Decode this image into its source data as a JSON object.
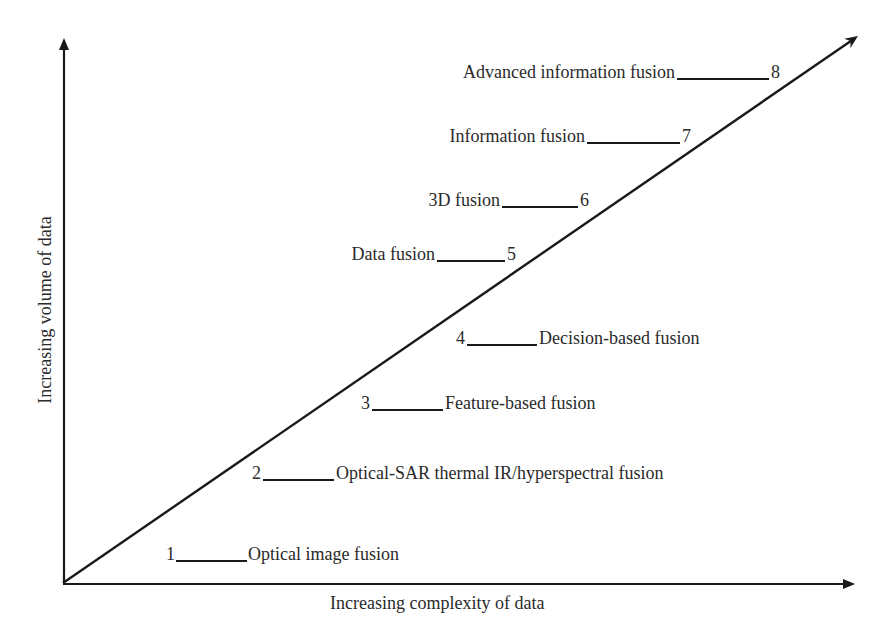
{
  "diagram": {
    "type": "stage-diagram",
    "axes": {
      "x_label": "Increasing complexity of data",
      "y_label": "Increasing volume of data",
      "origin": [
        63,
        583
      ],
      "x_end": [
        855,
        584
      ],
      "y_end": [
        64,
        38
      ],
      "diagonal_end": [
        858,
        36
      ],
      "stroke_color": "#1a1a1a"
    },
    "stages": [
      {
        "number": "1",
        "label": "Optical image fusion",
        "side": "right",
        "num_x": 166,
        "line_x1": 176,
        "line_x2": 247,
        "text_x": 248,
        "baseline": 559
      },
      {
        "number": "2",
        "label": "Optical-SAR thermal IR/hyperspectral fusion",
        "side": "right",
        "num_x": 252,
        "line_x1": 263,
        "line_x2": 334,
        "text_x": 336,
        "baseline": 478
      },
      {
        "number": "3",
        "label": "Feature-based fusion",
        "side": "right",
        "num_x": 361,
        "line_x1": 372,
        "line_x2": 443,
        "text_x": 445,
        "baseline": 408
      },
      {
        "number": "4",
        "label": "Decision-based fusion",
        "side": "right",
        "num_x": 456,
        "line_x1": 467,
        "line_x2": 537,
        "text_x": 539,
        "baseline": 343
      },
      {
        "number": "5",
        "label": "Data fusion",
        "side": "left",
        "text_x": 337,
        "line_x1": 437,
        "line_x2": 505,
        "num_x": 507,
        "baseline": 259
      },
      {
        "number": "6",
        "label": "3D fusion",
        "side": "left",
        "text_x": 416,
        "line_x1": 502,
        "line_x2": 578,
        "num_x": 580,
        "baseline": 205
      },
      {
        "number": "7",
        "label": "Information fusion",
        "side": "left",
        "text_x": 423,
        "line_x1": 587,
        "line_x2": 680,
        "num_x": 682,
        "baseline": 141
      },
      {
        "number": "8",
        "label": "Advanced information fusion",
        "side": "left",
        "text_x": 422,
        "line_x1": 677,
        "line_x2": 769,
        "num_x": 771,
        "baseline": 77
      }
    ]
  }
}
